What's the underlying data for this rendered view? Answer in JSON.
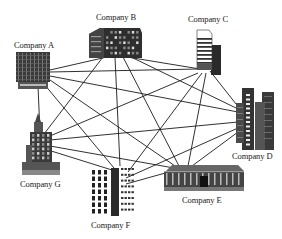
{
  "diagram": {
    "type": "complete-network",
    "nodes": [
      {
        "id": "A",
        "label": "Company A",
        "icon": "office-block-icon"
      },
      {
        "id": "B",
        "label": "Company B",
        "icon": "wide-office-building-icon"
      },
      {
        "id": "C",
        "label": "Company C",
        "icon": "tower-icon"
      },
      {
        "id": "D",
        "label": "Company D",
        "icon": "skyscraper-cluster-icon"
      },
      {
        "id": "E",
        "label": "Company E",
        "icon": "low-long-building-icon"
      },
      {
        "id": "F",
        "label": "Company F",
        "icon": "grid-windows-building-icon"
      },
      {
        "id": "G",
        "label": "Company G",
        "icon": "spired-tower-icon"
      }
    ],
    "edges": [
      [
        "A",
        "B"
      ],
      [
        "A",
        "C"
      ],
      [
        "A",
        "D"
      ],
      [
        "A",
        "E"
      ],
      [
        "A",
        "F"
      ],
      [
        "A",
        "G"
      ],
      [
        "B",
        "C"
      ],
      [
        "B",
        "D"
      ],
      [
        "B",
        "E"
      ],
      [
        "B",
        "F"
      ],
      [
        "B",
        "G"
      ],
      [
        "C",
        "D"
      ],
      [
        "C",
        "E"
      ],
      [
        "C",
        "F"
      ],
      [
        "C",
        "G"
      ],
      [
        "D",
        "E"
      ],
      [
        "D",
        "F"
      ],
      [
        "D",
        "G"
      ],
      [
        "E",
        "F"
      ],
      [
        "E",
        "G"
      ],
      [
        "F",
        "G"
      ]
    ],
    "colors": {
      "line": "#1a1a1a",
      "building": "#2a2a2a",
      "background": "#ffffff"
    }
  }
}
